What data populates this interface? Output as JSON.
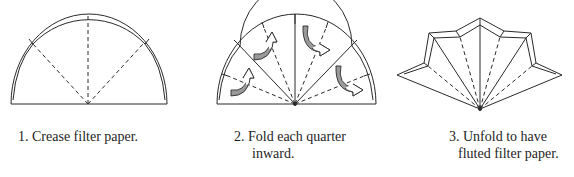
{
  "diagram": {
    "steps": [
      {
        "number": "1.",
        "caption_lines": [
          "1. Crease filter paper."
        ],
        "figure": "semicircle-with-creases"
      },
      {
        "number": "2.",
        "caption_lines": [
          "2. Fold each quarter",
          "inward."
        ],
        "figure": "semicircle-with-fold-arrows"
      },
      {
        "number": "3.",
        "caption_lines": [
          "3. Unfold to have",
          "fluted filter paper."
        ],
        "figure": "fluted-fan"
      }
    ],
    "colors": {
      "line": "#2a2a2a",
      "arrow_fill": "#9a9a9a",
      "background": "#ffffff"
    }
  }
}
